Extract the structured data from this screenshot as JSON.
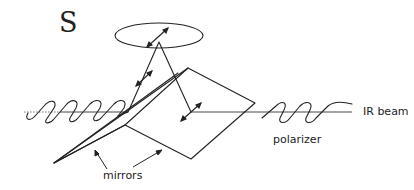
{
  "diagram": {
    "title_letter": "S",
    "labels": {
      "ir_beam": "IR beam",
      "polarizer": "polarizer",
      "mirrors": "mirrors"
    },
    "colors": {
      "ink": "#222222",
      "background": "#ffffff"
    },
    "elements": [
      {
        "name": "sample-ellipse",
        "kind": "ellipse"
      },
      {
        "name": "incident-wave",
        "kind": "sine-wave",
        "polarization": "s"
      },
      {
        "name": "outgoing-wave",
        "kind": "sine-wave"
      },
      {
        "name": "beam-axis",
        "kind": "line"
      },
      {
        "name": "upper-mirror",
        "kind": "plane"
      },
      {
        "name": "lower-mirror",
        "kind": "plane"
      },
      {
        "name": "reflected-ray-path",
        "kind": "polyline"
      },
      {
        "name": "polarization-arrows",
        "kind": "double-arrows"
      }
    ]
  }
}
